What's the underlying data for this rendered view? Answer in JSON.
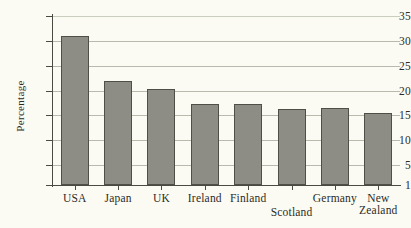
{
  "chart_data": {
    "type": "bar",
    "title": "",
    "subtitle": "",
    "xlabel": "",
    "ylabel": "Percentage",
    "ylim": [
      1,
      35
    ],
    "yticks": [
      1,
      5,
      10,
      15,
      20,
      25,
      30,
      35
    ],
    "ytick_labels": [
      "1",
      "5",
      "10",
      "15",
      "20",
      "25",
      "30",
      "35"
    ],
    "grid": true,
    "grid_axis": "y",
    "legend": "none",
    "bar_color": "#8d8d85",
    "bar_edge_color": "#4f4f48",
    "axis_color": "#4a4a42",
    "background_color": "#fbfbf4",
    "categories": [
      "USA",
      "Japan",
      "UK",
      "Ireland",
      "Finland",
      "Scotland",
      "Germany",
      "New Zealand"
    ],
    "values": [
      31.0,
      22.0,
      20.3,
      17.3,
      17.3,
      16.3,
      16.4,
      15.4
    ],
    "series": [
      {
        "name": "Percentage",
        "values": [
          31.0,
          22.0,
          20.3,
          17.3,
          17.3,
          16.3,
          16.4,
          15.4
        ]
      }
    ],
    "category_labels": [
      {
        "line1": "USA",
        "line2": "",
        "stagger": false
      },
      {
        "line1": "Japan",
        "line2": "",
        "stagger": false
      },
      {
        "line1": "UK",
        "line2": "",
        "stagger": false
      },
      {
        "line1": "Ireland",
        "line2": "",
        "stagger": false
      },
      {
        "line1": "Finland",
        "line2": "",
        "stagger": false
      },
      {
        "line1": "Scotland",
        "line2": "",
        "stagger": true
      },
      {
        "line1": "Germany",
        "line2": "",
        "stagger": false
      },
      {
        "line1": "New",
        "line2": "Zealand",
        "stagger": false
      }
    ]
  }
}
